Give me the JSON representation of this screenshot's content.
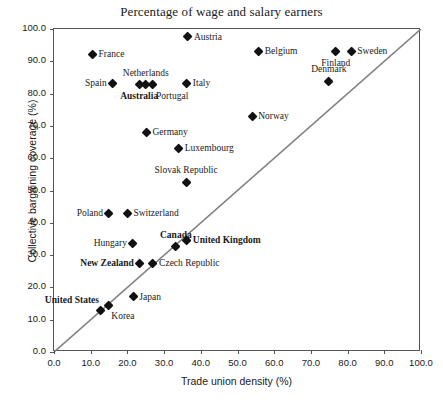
{
  "chart_data": {
    "type": "scatter",
    "title": "Percentage of wage and salary earners",
    "xlabel": "Trade union density (%)",
    "ylabel": "Collective bargaining coverage (%)",
    "xlim": [
      0,
      100
    ],
    "ylim": [
      0,
      100
    ],
    "grid": false,
    "legend": "none",
    "reference_line": {
      "name": "45-degree-line",
      "from": [
        0,
        0
      ],
      "to": [
        100,
        100
      ],
      "color": "#808080"
    },
    "xticks": [
      "0.0",
      "10.0",
      "20.0",
      "30.0",
      "40.0",
      "50.0",
      "60.0",
      "70.0",
      "80.0",
      "90.0",
      "100.0"
    ],
    "yticks": [
      "0.0",
      "10.0",
      "20.0",
      "30.0",
      "40.0",
      "50.0",
      "60.0",
      "70.0",
      "80.0",
      "90.0",
      "100.0"
    ],
    "points": [
      {
        "label": "Austria",
        "x": 36.5,
        "y": 97.5,
        "pos": "right",
        "bold": false
      },
      {
        "label": "France",
        "x": 10.5,
        "y": 92.0,
        "pos": "right",
        "bold": false
      },
      {
        "label": "Belgium",
        "x": 55.8,
        "y": 93.0,
        "pos": "right",
        "bold": false
      },
      {
        "label": "Sweden",
        "x": 81.0,
        "y": 93.0,
        "pos": "right",
        "bold": false
      },
      {
        "label": "Finland",
        "x": 76.8,
        "y": 93.0,
        "pos": "below",
        "bold": false
      },
      {
        "label": "Denmark",
        "x": 74.9,
        "y": 83.8,
        "pos": "above",
        "bold": false
      },
      {
        "label": "Spain",
        "x": 16.0,
        "y": 83.0,
        "pos": "left",
        "bold": false
      },
      {
        "label": "Australia",
        "x": 23.2,
        "y": 82.7,
        "pos": "below",
        "bold": true
      },
      {
        "label": "Netherlands",
        "x": 25.0,
        "y": 82.7,
        "pos": "above",
        "bold": false
      },
      {
        "label": "Portugal",
        "x": 27.0,
        "y": 82.7,
        "pos": "below-right",
        "bold": false
      },
      {
        "label": "Italy",
        "x": 36.2,
        "y": 83.0,
        "pos": "right",
        "bold": false
      },
      {
        "label": "Norway",
        "x": 54.0,
        "y": 73.0,
        "pos": "right",
        "bold": false
      },
      {
        "label": "Germany",
        "x": 25.2,
        "y": 68.0,
        "pos": "right",
        "bold": false
      },
      {
        "label": "Luxembourg",
        "x": 34.0,
        "y": 63.0,
        "pos": "right",
        "bold": false
      },
      {
        "label": "Slovak Republic",
        "x": 36.0,
        "y": 52.5,
        "pos": "above",
        "bold": false
      },
      {
        "label": "Poland",
        "x": 15.0,
        "y": 43.0,
        "pos": "left",
        "bold": false
      },
      {
        "label": "Switzerland",
        "x": 20.0,
        "y": 43.0,
        "pos": "right",
        "bold": false
      },
      {
        "label": "Hungary",
        "x": 21.5,
        "y": 33.5,
        "pos": "left",
        "bold": false
      },
      {
        "label": "Canada",
        "x": 33.2,
        "y": 32.5,
        "pos": "above",
        "bold": true
      },
      {
        "label": "United Kingdom",
        "x": 36.2,
        "y": 34.5,
        "pos": "right",
        "bold": true
      },
      {
        "label": "New Zealand",
        "x": 23.4,
        "y": 27.5,
        "pos": "left",
        "bold": true
      },
      {
        "label": "Czech Republic",
        "x": 27.0,
        "y": 27.5,
        "pos": "right",
        "bold": false
      },
      {
        "label": "Japan",
        "x": 21.6,
        "y": 17.0,
        "pos": "right",
        "bold": false
      },
      {
        "label": "Korea",
        "x": 14.8,
        "y": 14.5,
        "pos": "below-right",
        "bold": false
      },
      {
        "label": "United States",
        "x": 12.8,
        "y": 12.8,
        "pos": "above-left",
        "bold": true
      }
    ]
  }
}
